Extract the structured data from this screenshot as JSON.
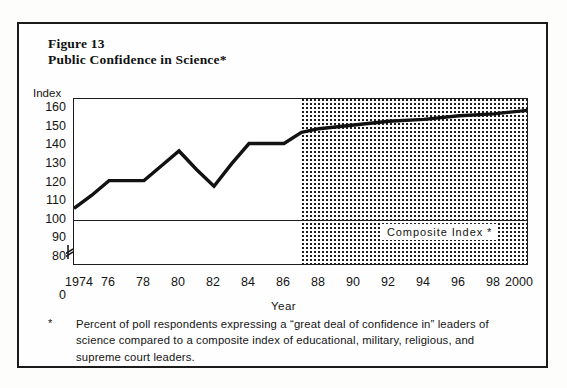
{
  "figure": {
    "number": "Figure 13",
    "title": "Public Confidence in Science*",
    "index_axis_label": "Index",
    "year_axis_label": "Year",
    "composite_label": "Composite  Index   *",
    "footnote_marker": "*",
    "footnote_text": "Percent of poll respondents expressing a “great deal of confidence in” leaders of science compared to a composite index of educational, military, religious, and supreme court leaders."
  },
  "colors": {
    "ink": "#1d1d1d",
    "line": "#121212",
    "page": "#fefefe",
    "stipple": "#1d1d1d"
  },
  "chart_data": {
    "type": "line",
    "title": "Public Confidence in Science*",
    "xlabel": "Year",
    "ylabel": "Index",
    "ylim": [
      75,
      165
    ],
    "xlim": [
      1974,
      2000
    ],
    "grid": false,
    "legend": "none",
    "y_ticks": [
      160,
      150,
      140,
      130,
      120,
      110,
      100,
      90,
      80,
      0
    ],
    "y_axis_break_between": [
      80,
      0
    ],
    "x_ticks": [
      1974,
      1976,
      1978,
      1980,
      1982,
      1984,
      1986,
      1988,
      1990,
      1992,
      1994,
      1996,
      1998,
      2000
    ],
    "x_tick_labels": [
      "1974",
      "76",
      "78",
      "80",
      "82",
      "84",
      "86",
      "88",
      "90",
      "92",
      "94",
      "96",
      "98",
      "2000"
    ],
    "reference_line": {
      "value": 100,
      "label": "Composite  Index   *"
    },
    "forecast_region": {
      "start_year": 1987,
      "end_year": 2000,
      "style": "stippled"
    },
    "series": [
      {
        "name": "Public Confidence in Science",
        "x": [
          1974,
          1975,
          1976,
          1977,
          1978,
          1979,
          1980,
          1981,
          1982,
          1983,
          1984,
          1985,
          1986,
          1987,
          1988,
          1990,
          1992,
          1994,
          1996,
          1998,
          2000
        ],
        "values": [
          106,
          113,
          121,
          121,
          121,
          129,
          137,
          127,
          118,
          130,
          141,
          141,
          141,
          147,
          149,
          151,
          153,
          154,
          156,
          157,
          159
        ]
      }
    ]
  }
}
